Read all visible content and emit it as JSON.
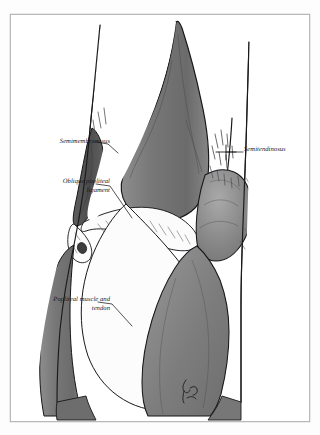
{
  "figure": {
    "medium": "grayscale pen-and-ink anatomical illustration",
    "frame_border_color": "#b9b9b9",
    "page_background": "#ffffff"
  },
  "palette": {
    "ink": "#15161a",
    "outline": "#1a1a1d",
    "muscle_mid_gray": "#7a7a7a",
    "muscle_dark_gray": "#595959",
    "muscle_darkest_gray": "#464646",
    "muscle_light_gray": "#9a9a9a",
    "tendon_white": "#fbfbfb",
    "hatch_gray": "#6f6f6f",
    "frame_gray": "#b9b9b9"
  },
  "labels": [
    {
      "id": "semimembranosus",
      "text": "Semimembranosus",
      "align": "right",
      "leader": "line extends right and downward to the semimembranosus muscle belly"
    },
    {
      "id": "oblique-popliteal-ligament",
      "line1": "Oblique popliteal",
      "line2": "ligament",
      "text": "Oblique popliteal ligament",
      "align": "right",
      "leader": "line extends right and downward to the oblique popliteal ligament fibers"
    },
    {
      "id": "popliteal-muscle-and-tendon",
      "line1": "Popliteal muscle and",
      "line2": "tendon",
      "text": "Popliteal muscle and tendon",
      "align": "right",
      "leader": "line extends right and downward to the popliteus muscle and tendon"
    },
    {
      "id": "semitendinosus",
      "text": "Semitendinosus",
      "align": "left",
      "leader": "line extends left to a small cross mark over the semitendinosus tendon"
    }
  ],
  "anatomy_structures": [
    {
      "name": "Semimembranosus",
      "shading": "dark gray muscle belly, upper medial (left) side"
    },
    {
      "name": "Semitendinosus",
      "shading": "narrow tendon cord, upper lateral (right) side"
    },
    {
      "name": "Oblique popliteal ligament",
      "shading": "white hatched fibrous band across joint line"
    },
    {
      "name": "Popliteal muscle and tendon",
      "shading": "white tendon sheet sweeping down and left"
    },
    {
      "name": "Medial head of gastrocnemius",
      "shading": "large mid-gray tapering muscle belly, center"
    },
    {
      "name": "Lateral head of gastrocnemius",
      "shading": "mid-gray muscle belly, lower right"
    },
    {
      "name": "Femoral condyle",
      "shading": "rounded gray mass at joint, lower right"
    }
  ],
  "signature": {
    "present": true,
    "text": "artist signature (cursive, illegible)",
    "position": "bottom center-right, vertical cursive mark"
  }
}
